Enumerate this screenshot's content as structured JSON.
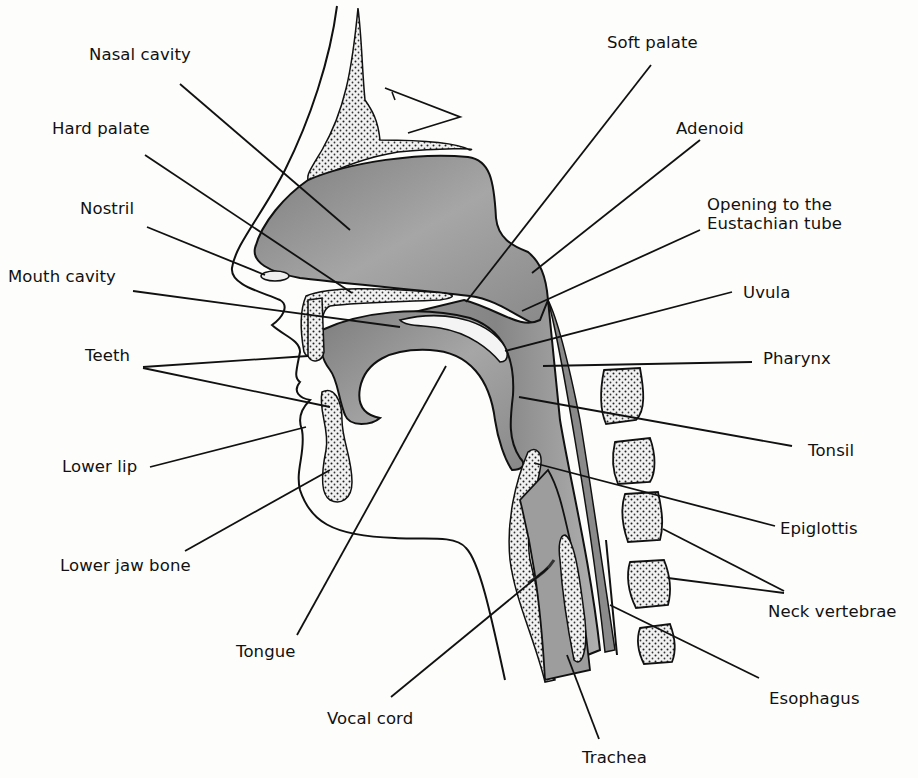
{
  "figure": {
    "colors": {
      "background": "#fdfdfb",
      "ink": "#111111",
      "tissue_gray": "#8c8c8c",
      "tissue_light": "#b5b5b5",
      "bone_fill": "#ececec"
    },
    "labels": [
      {
        "id": "nasal-cavity",
        "text": "Nasal cavity",
        "x": 89,
        "y": 54,
        "line": [
          [
            180,
            84
          ],
          [
            350,
            230
          ]
        ]
      },
      {
        "id": "hard-palate",
        "text": "Hard palate",
        "x": 52,
        "y": 128,
        "line": [
          [
            145,
            155
          ],
          [
            352,
            293
          ]
        ]
      },
      {
        "id": "nostril",
        "text": "Nostril",
        "x": 80,
        "y": 208,
        "line": [
          [
            147,
            227
          ],
          [
            265,
            275
          ]
        ]
      },
      {
        "id": "mouth-cavity",
        "text": "Mouth cavity",
        "x": 8,
        "y": 276,
        "line": [
          [
            133,
            291
          ],
          [
            400,
            327
          ]
        ]
      },
      {
        "id": "teeth",
        "text": "Teeth",
        "x": 85,
        "y": 355,
        "line": [
          [
            143,
            367
          ],
          [
            308,
            356
          ]
        ]
      },
      {
        "id": "teeth-lower",
        "text": "",
        "x": 0,
        "y": 0,
        "line": [
          [
            143,
            368
          ],
          [
            330,
            407
          ]
        ]
      },
      {
        "id": "lower-lip",
        "text": "Lower lip",
        "x": 62,
        "y": 456,
        "line": [
          [
            150,
            467
          ],
          [
            306,
            427
          ]
        ]
      },
      {
        "id": "lower-jaw-bone",
        "text": "Lower jaw bone",
        "x": 60,
        "y": 556,
        "line": [
          [
            185,
            551
          ],
          [
            330,
            470
          ]
        ]
      },
      {
        "id": "tongue",
        "text": "Tongue",
        "x": 236,
        "y": 642,
        "line": [
          [
            297,
            635
          ],
          [
            446,
            366
          ]
        ]
      },
      {
        "id": "vocal-cord",
        "text": "Vocal cord",
        "x": 327,
        "y": 709,
        "line": [
          [
            391,
            697
          ],
          [
            548,
            568
          ]
        ]
      },
      {
        "id": "trachea",
        "text": "Trachea",
        "x": 582,
        "y": 748,
        "line": [
          [
            599,
            739
          ],
          [
            567,
            655
          ]
        ]
      },
      {
        "id": "soft-palate",
        "text": "Soft palate",
        "x": 607,
        "y": 33,
        "line": [
          [
            651,
            65
          ],
          [
            466,
            302
          ]
        ]
      },
      {
        "id": "adenoid",
        "text": "Adenoid",
        "x": 676,
        "y": 119,
        "line": [
          [
            700,
            140
          ],
          [
            532,
            273
          ]
        ]
      },
      {
        "id": "eustachian-tube",
        "text": "Opening to the\nEustachian tube",
        "x": 707,
        "y": 195,
        "line": [
          [
            700,
            230
          ],
          [
            522,
            311
          ]
        ]
      },
      {
        "id": "uvula",
        "text": "Uvula",
        "x": 743,
        "y": 283,
        "line": [
          [
            732,
            292
          ],
          [
            505,
            351
          ]
        ]
      },
      {
        "id": "pharynx",
        "text": "Pharynx",
        "x": 763,
        "y": 349,
        "line": [
          [
            752,
            362
          ],
          [
            543,
            366
          ]
        ]
      },
      {
        "id": "tonsil",
        "text": "Tonsil",
        "x": 808,
        "y": 441,
        "line": [
          [
            792,
            446
          ],
          [
            519,
            397
          ]
        ]
      },
      {
        "id": "epiglottis",
        "text": "Epiglottis",
        "x": 780,
        "y": 519,
        "line": [
          [
            775,
            526
          ],
          [
            534,
            463
          ]
        ]
      },
      {
        "id": "neck-vertebrae",
        "text": "Neck vertebrae",
        "x": 768,
        "y": 602,
        "line": [
          [
            784,
            591
          ],
          [
            663,
            529
          ]
        ]
      },
      {
        "id": "neck-vertebrae-2",
        "text": "",
        "x": 0,
        "y": 0,
        "line": [
          [
            784,
            593
          ],
          [
            668,
            578
          ]
        ]
      },
      {
        "id": "esophagus",
        "text": "Esophagus",
        "x": 769,
        "y": 689,
        "line": [
          [
            759,
            678
          ],
          [
            610,
            605
          ]
        ]
      }
    ]
  }
}
